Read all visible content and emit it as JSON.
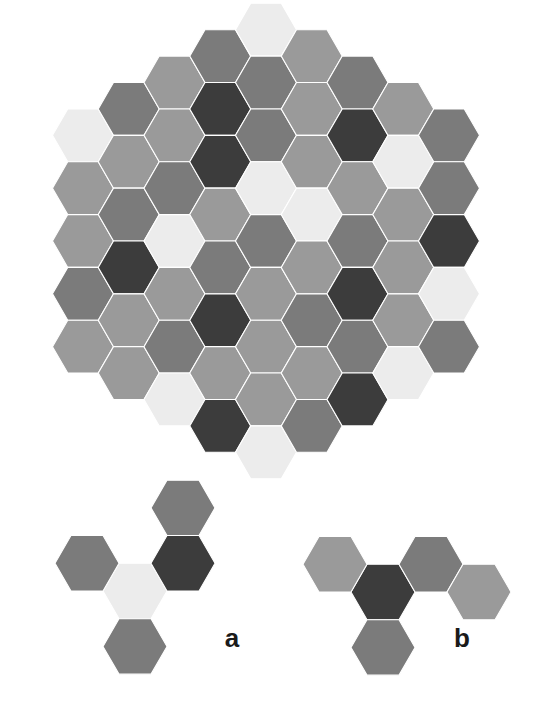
{
  "figure": {
    "type": "hexagonal-tiling-diagram",
    "background_color": "#ffffff",
    "palette": {
      "light": "#ececec",
      "mid_light": "#9a9a9a",
      "mid_dark": "#7b7b7b",
      "dark": "#3c3c3c"
    },
    "palette_order": [
      "light",
      "mid_light",
      "mid_dark",
      "dark"
    ],
    "main_grid": {
      "name": "main-hex-tiling",
      "shape": "hexagon-of-hexagons",
      "orientation": "flat-top",
      "radius": 4,
      "center_x": 266,
      "center_y": 241,
      "hex_size": 30.5,
      "columns": [
        {
          "q": -4,
          "count": 5,
          "colors": [
            "light",
            "mid_light",
            "mid_light",
            "mid_dark",
            "mid_light"
          ]
        },
        {
          "q": -3,
          "count": 6,
          "colors": [
            "mid_dark",
            "mid_light",
            "mid_dark",
            "dark",
            "mid_light",
            "mid_light"
          ]
        },
        {
          "q": -2,
          "count": 7,
          "colors": [
            "mid_light",
            "mid_light",
            "mid_dark",
            "light",
            "mid_light",
            "mid_dark",
            "light"
          ]
        },
        {
          "q": -1,
          "count": 8,
          "colors": [
            "mid_dark",
            "dark",
            "dark",
            "mid_light",
            "mid_dark",
            "dark",
            "mid_light",
            "dark"
          ]
        },
        {
          "q": 0,
          "count": 9,
          "colors": [
            "light",
            "mid_dark",
            "mid_dark",
            "light",
            "mid_dark",
            "mid_light",
            "mid_light",
            "mid_light",
            "light"
          ]
        },
        {
          "q": 1,
          "count": 8,
          "colors": [
            "mid_light",
            "mid_light",
            "mid_light",
            "light",
            "mid_light",
            "mid_dark",
            "mid_light",
            "mid_dark"
          ]
        },
        {
          "q": 2,
          "count": 7,
          "colors": [
            "mid_dark",
            "dark",
            "mid_light",
            "mid_dark",
            "dark",
            "mid_dark",
            "dark"
          ]
        },
        {
          "q": 3,
          "count": 6,
          "colors": [
            "mid_light",
            "light",
            "mid_light",
            "mid_light",
            "mid_light",
            "light"
          ]
        },
        {
          "q": 4,
          "count": 5,
          "colors": [
            "mid_dark",
            "mid_dark",
            "dark",
            "light",
            "mid_dark"
          ]
        }
      ]
    },
    "panels": [
      {
        "id": "a",
        "name": "panel-a",
        "label": "a",
        "label_x": 232,
        "label_y": 647,
        "center_x": 135,
        "center_y": 591,
        "hex_size": 32,
        "cells": [
          {
            "name": "panel-a-center-hex",
            "q": 0,
            "r": 0,
            "color": "light"
          },
          {
            "name": "panel-a-neighbor-upper-right-hex",
            "q": 1,
            "r": -1,
            "color": "dark"
          },
          {
            "name": "panel-a-neighbor-top-hex",
            "q": 1,
            "r": -2,
            "color": "mid_dark"
          },
          {
            "name": "panel-a-neighbor-upper-left-hex",
            "q": -1,
            "r": 0,
            "color": "mid_dark"
          },
          {
            "name": "panel-a-neighbor-bottom-hex",
            "q": 0,
            "r": 1,
            "color": "mid_dark"
          }
        ]
      },
      {
        "id": "b",
        "name": "panel-b",
        "label": "b",
        "label_x": 462,
        "label_y": 647,
        "center_x": 383,
        "center_y": 592,
        "hex_size": 32,
        "cells": [
          {
            "name": "panel-b-center-hex",
            "q": 0,
            "r": 0,
            "color": "dark"
          },
          {
            "name": "panel-b-neighbor-upper-left-hex",
            "q": -1,
            "r": 0,
            "color": "mid_light"
          },
          {
            "name": "panel-b-neighbor-upper-right-hex",
            "q": 1,
            "r": -1,
            "color": "mid_dark"
          },
          {
            "name": "panel-b-neighbor-right-hex",
            "q": 2,
            "r": -1,
            "color": "mid_light"
          },
          {
            "name": "panel-b-neighbor-bottom-hex",
            "q": 0,
            "r": 1,
            "color": "mid_dark"
          }
        ]
      }
    ]
  }
}
